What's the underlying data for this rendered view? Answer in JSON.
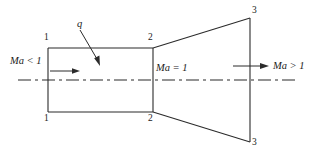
{
  "figure": {
    "stroke_color": "#2b2b2b",
    "text_color": "#1a1a1a",
    "background": "#ffffff"
  },
  "labels": {
    "heat_flux": "q",
    "inlet_mach": "Ma < 1",
    "throat_mach": "Ma = 1",
    "exit_mach": "Ma > 1",
    "station_1_top": "1",
    "station_1_bottom": "1",
    "station_2_top": "2",
    "station_2_bottom": "2",
    "station_3_top": "3",
    "station_3_bottom": "3"
  },
  "geometry": {
    "duct_top_y": 48,
    "duct_bottom_y": 112,
    "inlet_x": 48,
    "throat_x": 153,
    "exit_x": 250,
    "exit_top_y": 18,
    "exit_bottom_y": 142,
    "centerline_y": 80
  }
}
